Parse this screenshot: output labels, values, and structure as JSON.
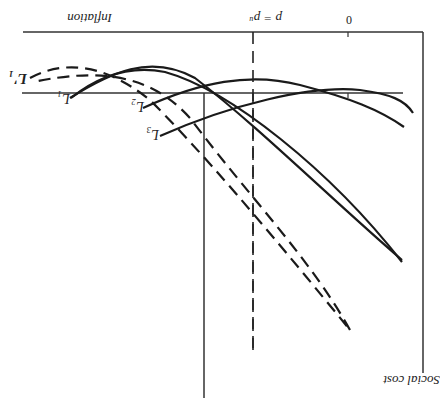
{
  "orientation": "rotated 180 degrees",
  "axes": {
    "y_label": "Social cost",
    "x_label": "Inflation",
    "zero_tick": "0",
    "vline_label": "p = pᵘ"
  },
  "curves": [
    {
      "name": "L1'",
      "label": "L′₁",
      "style": "dashed"
    },
    {
      "name": "L1",
      "label": "L₁",
      "style": "solid"
    },
    {
      "name": "L2",
      "label": "L₂",
      "style": "solid"
    },
    {
      "name": "L3",
      "label": "L₃",
      "style": "solid"
    }
  ],
  "colors": {
    "line": "#1a1a1a",
    "background": "#ffffff"
  }
}
